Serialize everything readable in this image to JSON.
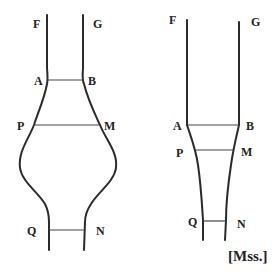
{
  "figures": {
    "left": {
      "labels": {
        "F": "F",
        "G": "G",
        "A": "A",
        "B": "B",
        "P": "P",
        "M": "M",
        "Q": "Q",
        "N": "N"
      },
      "shape": "tube-with-bulb"
    },
    "right": {
      "labels": {
        "F": "F",
        "G": "G",
        "A": "A",
        "B": "B",
        "P": "P",
        "M": "M",
        "Q": "Q",
        "N": "N"
      },
      "shape": "tube-with-taper"
    }
  },
  "caption": "[Mss.]",
  "colors": {
    "ink": "#2a2a2a",
    "background": "#ffffff"
  }
}
